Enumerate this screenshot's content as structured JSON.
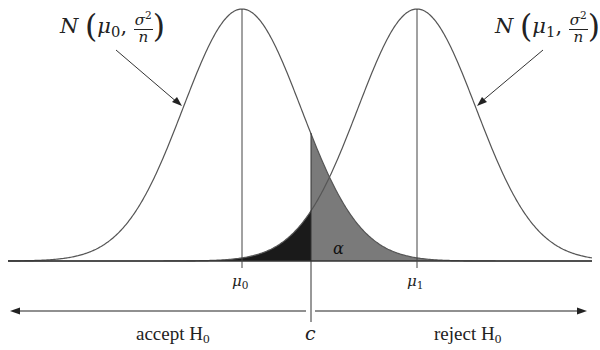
{
  "diagram": {
    "title": "",
    "type": "hypothesis-test-normal-distributions",
    "curves": [
      {
        "id": "null",
        "label_func": "N",
        "label_mean": "μ",
        "label_mean_sub": "0",
        "label_var_num": "σ",
        "label_var_sup": "2",
        "label_var_den": "n",
        "mean_label": "μ",
        "mean_sub": "0"
      },
      {
        "id": "alternative",
        "label_func": "N",
        "label_mean": "μ",
        "label_mean_sub": "1",
        "label_var_num": "σ",
        "label_var_sup": "2",
        "label_var_den": "n",
        "mean_label": "μ",
        "mean_sub": "1"
      }
    ],
    "critical_value": "c",
    "alpha_label": "α",
    "regions": {
      "accept": {
        "text": "accept H",
        "sub": "0"
      },
      "reject": {
        "text": "reject H",
        "sub": "0"
      }
    },
    "colors": {
      "curve": "#555555",
      "axis": "#333333",
      "alpha_fill": "#7a7a7a",
      "beta_fill": "#1a1a1a",
      "background": "#ffffff"
    }
  }
}
